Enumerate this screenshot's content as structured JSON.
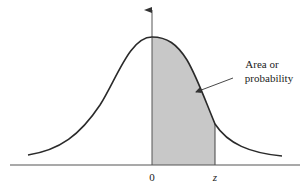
{
  "diagram": {
    "type": "standard-normal-curve-shaded-area",
    "annotation": {
      "line1": "Area or",
      "line2": "probability"
    },
    "x_labels": {
      "origin": "0",
      "z": "z"
    },
    "colors": {
      "curve": "#2a2a2a",
      "shade": "#c8c8c8",
      "axis": "#555555",
      "background": "#ffffff"
    }
  }
}
